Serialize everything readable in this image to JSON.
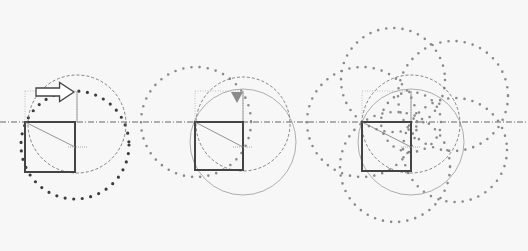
{
  "colors": {
    "background": "#f7f7f7",
    "square": "#444444",
    "axis": "#555555",
    "dashed_circle": "#666666",
    "thin_circle": "#9a9a9a",
    "dark_dots": "#3c3c3c",
    "gray_dots": "#8a8a8a",
    "arrow_fill": "#ffffff",
    "arrow_stroke": "#444444",
    "marker": "#8a8a8a"
  },
  "axis": {
    "y": 122,
    "x1": 0,
    "x2": 528
  },
  "panels": [
    {
      "id": "panel-1",
      "square": {
        "x": 25,
        "y": 122,
        "size": 50
      },
      "diagonal": {
        "x1": 25,
        "y1": 122,
        "x2": 75,
        "y2": 147
      },
      "guide_rect": {
        "x": 25,
        "y": 91,
        "w": 52,
        "h": 31
      },
      "tick": {
        "x1": 68,
        "x2": 88,
        "y": 147
      },
      "dashed_circle": {
        "cx": 77,
        "cy": 124,
        "r": 49
      },
      "thin_circle": null,
      "dotted_circles": [
        {
          "cx": 75,
          "cy": 145,
          "r": 54,
          "style": "dark"
        }
      ],
      "arrow": {
        "x": 36,
        "y": 84,
        "w": 38,
        "h": 16,
        "direction": "right"
      },
      "marker": null
    },
    {
      "id": "panel-2",
      "square": {
        "x": 195,
        "y": 122,
        "size": 48
      },
      "diagonal": {
        "x1": 195,
        "y1": 122,
        "x2": 243,
        "y2": 147
      },
      "guide_rect": {
        "x": 195,
        "y": 91,
        "w": 48,
        "h": 31
      },
      "tick": {
        "x1": 233,
        "x2": 253,
        "y": 147
      },
      "dashed_circle": {
        "cx": 243,
        "cy": 124,
        "r": 47
      },
      "thin_circle": {
        "cx": 243,
        "cy": 142,
        "r": 53
      },
      "dotted_circles": [
        {
          "cx": 196,
          "cy": 122,
          "r": 55,
          "style": "gray"
        }
      ],
      "arrow": null,
      "marker": {
        "x": 237,
        "y": 98,
        "direction": "down"
      }
    },
    {
      "id": "panel-3",
      "square": {
        "x": 362,
        "y": 122,
        "size": 49
      },
      "diagonal": {
        "x1": 362,
        "y1": 122,
        "x2": 411,
        "y2": 147
      },
      "guide_rect": {
        "x": 362,
        "y": 91,
        "w": 49,
        "h": 31
      },
      "tick": {
        "x1": 401,
        "x2": 421,
        "y": 147
      },
      "dashed_circle": {
        "cx": 411,
        "cy": 124,
        "r": 49
      },
      "thin_circle": {
        "cx": 411,
        "cy": 142,
        "r": 53
      },
      "dotted_circles": [
        {
          "cx": 362,
          "cy": 122,
          "r": 55,
          "style": "gray"
        },
        {
          "cx": 393,
          "cy": 80,
          "r": 52,
          "style": "gray"
        },
        {
          "cx": 453,
          "cy": 96,
          "r": 55,
          "style": "gray"
        },
        {
          "cx": 395,
          "cy": 167,
          "r": 55,
          "style": "gray"
        },
        {
          "cx": 455,
          "cy": 150,
          "r": 52,
          "style": "gray"
        },
        {
          "cx": 411,
          "cy": 122,
          "r": 30,
          "style": "gray"
        }
      ],
      "arrow": null,
      "marker": null
    }
  ]
}
